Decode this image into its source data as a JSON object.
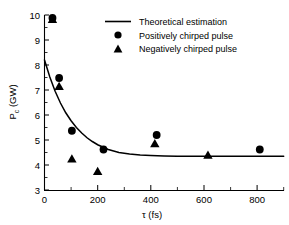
{
  "chart_data": {
    "type": "scatter",
    "title": "",
    "xlabel": "τ (fs)",
    "ylabel": "P",
    "ylabel_sub": "c",
    "ylabel_unit": " (GW)",
    "ylabel_full": "P_c (GW)",
    "xlim": [
      0,
      900
    ],
    "ylim": [
      3,
      10
    ],
    "xticks": [
      0,
      200,
      400,
      600,
      800
    ],
    "xtick_labels": [
      "0",
      "200",
      "400",
      "600",
      "800"
    ],
    "yticks": [
      3,
      4,
      5,
      6,
      7,
      8,
      9,
      10
    ],
    "ytick_labels": [
      "3",
      "4",
      "5",
      "6",
      "7",
      "8",
      "9",
      "10"
    ],
    "x_minor_interval": 100,
    "y_minor_interval": 0.5,
    "grid": false,
    "legend_position": "top-right",
    "frame": "left-bottom",
    "series": [
      {
        "name": "Theoretical estimation",
        "type": "line",
        "marker": "line",
        "color": "#000000",
        "model": "exponential_decay",
        "params": {
          "y0": 4.35,
          "amplitude": 3.85,
          "tau": 105
        },
        "x": [
          0,
          20,
          40,
          60,
          80,
          100,
          120,
          140,
          160,
          180,
          200,
          240,
          280,
          320,
          360,
          400,
          450,
          500,
          560,
          620,
          700,
          800,
          900
        ],
        "y": [
          8.2,
          7.52,
          6.95,
          6.48,
          6.09,
          5.77,
          5.5,
          5.28,
          5.09,
          4.94,
          4.81,
          4.62,
          4.5,
          4.44,
          4.4,
          4.38,
          4.36,
          4.35,
          4.35,
          4.35,
          4.35,
          4.35,
          4.35
        ]
      },
      {
        "name": "Positively chirped pulse",
        "type": "scatter",
        "marker": "circle",
        "color": "#000000",
        "points": [
          {
            "x": 30,
            "y": 9.88
          },
          {
            "x": 55,
            "y": 7.48
          },
          {
            "x": 103,
            "y": 5.37
          },
          {
            "x": 222,
            "y": 4.62
          },
          {
            "x": 422,
            "y": 5.2
          },
          {
            "x": 810,
            "y": 4.62
          }
        ]
      },
      {
        "name": "Negatively chirped pulse",
        "type": "scatter",
        "marker": "triangle",
        "color": "#000000",
        "points": [
          {
            "x": 30,
            "y": 9.83
          },
          {
            "x": 55,
            "y": 7.15
          },
          {
            "x": 103,
            "y": 4.25
          },
          {
            "x": 200,
            "y": 3.75
          },
          {
            "x": 415,
            "y": 4.86
          },
          {
            "x": 615,
            "y": 4.4
          }
        ]
      }
    ],
    "legend": [
      {
        "label": "Theoretical estimation",
        "marker": "line"
      },
      {
        "label": "Positively chirped pulse",
        "marker": "circle"
      },
      {
        "label": "Negatively chirped pulse",
        "marker": "triangle"
      }
    ]
  }
}
